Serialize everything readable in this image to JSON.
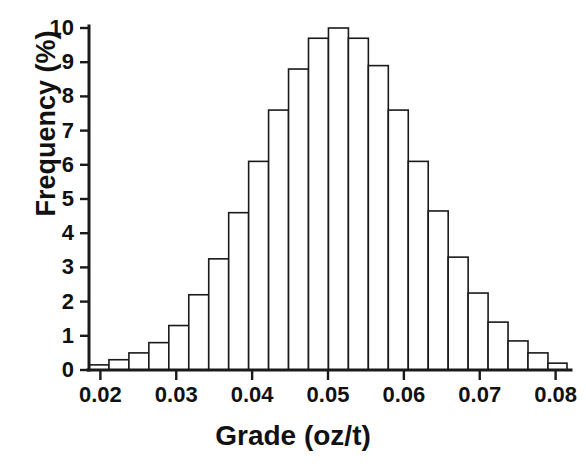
{
  "chart_data": {
    "type": "bar",
    "title": "",
    "xlabel": "Grade (oz/t)",
    "ylabel": "Frequency (%)",
    "xlim": [
      0.0185,
      0.0815
    ],
    "ylim": [
      0,
      10
    ],
    "grid": false,
    "legend": null,
    "bin_width": 0.00263,
    "xtick_labels": [
      "0.02",
      "0.03",
      "0.04",
      "0.05",
      "0.06",
      "0.07",
      "0.08"
    ],
    "xtick_values": [
      0.02,
      0.03,
      0.04,
      0.05,
      0.06,
      0.07,
      0.08
    ],
    "ytick_labels": [
      "0",
      "1",
      "2",
      "3",
      "4",
      "5",
      "6",
      "7",
      "8",
      "9",
      "10"
    ],
    "ytick_values": [
      0,
      1,
      2,
      3,
      4,
      5,
      6,
      7,
      8,
      9,
      10
    ],
    "bin_edges": [
      0.0185,
      0.02113,
      0.02376,
      0.02639,
      0.02902,
      0.03165,
      0.03428,
      0.03691,
      0.03954,
      0.04217,
      0.0448,
      0.04743,
      0.05006,
      0.05269,
      0.05532,
      0.05795,
      0.06058,
      0.06321,
      0.06584,
      0.06847,
      0.0711,
      0.07373,
      0.07636,
      0.07899,
      0.0815
    ],
    "bin_centers": [
      0.0198,
      0.0224,
      0.0251,
      0.0277,
      0.0303,
      0.033,
      0.0356,
      0.0382,
      0.0409,
      0.0435,
      0.0461,
      0.0487,
      0.0514,
      0.054,
      0.0566,
      0.0593,
      0.0619,
      0.0645,
      0.0672,
      0.0698,
      0.0724,
      0.075,
      0.0777,
      0.0803
    ],
    "categories": [
      "0.0198",
      "0.0224",
      "0.0251",
      "0.0277",
      "0.0303",
      "0.0330",
      "0.0356",
      "0.0382",
      "0.0409",
      "0.0435",
      "0.0461",
      "0.0487",
      "0.0514",
      "0.0540",
      "0.0566",
      "0.0593",
      "0.0619",
      "0.0645",
      "0.0672",
      "0.0698",
      "0.0724",
      "0.0750",
      "0.0777",
      "0.0803"
    ],
    "values": [
      0.15,
      0.3,
      0.5,
      0.8,
      1.3,
      2.2,
      3.25,
      4.6,
      6.1,
      7.6,
      8.8,
      9.7,
      10.0,
      9.7,
      8.9,
      7.6,
      6.1,
      4.65,
      3.3,
      2.25,
      1.4,
      0.85,
      0.5,
      0.2
    ]
  }
}
